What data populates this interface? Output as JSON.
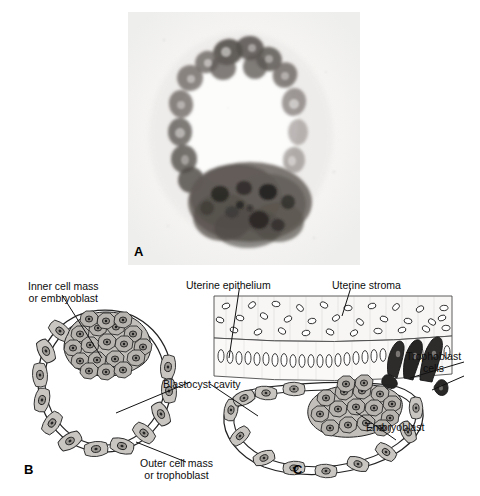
{
  "figure": {
    "domain": "biology-histology-figure",
    "background_color": "#ffffff",
    "panels": [
      {
        "letter": "A",
        "type": "photomicrograph",
        "description": "Histological section of a human blastocyst showing trophoblast ring, blastocyst cavity and inner cell mass"
      },
      {
        "letter": "B",
        "type": "line-diagram",
        "description": "Free blastocyst with inner cell mass, blastocyst cavity and outer cell mass"
      },
      {
        "letter": "C",
        "type": "line-diagram",
        "description": "Blastocyst implanting in the uterine wall"
      }
    ]
  },
  "panel_a": {
    "letter": "A"
  },
  "panel_b": {
    "letter": "B",
    "labels": {
      "inner_cell_mass_line1": "Inner cell mass",
      "inner_cell_mass_line2": "or embryoblast",
      "blastocyst_cavity": "Blastocyst cavity",
      "outer_cell_mass_line1": "Outer cell mass",
      "outer_cell_mass_line2": "or trophoblast"
    }
  },
  "panel_c": {
    "letter": "C",
    "labels": {
      "uterine_epithelium": "Uterine epithelium",
      "uterine_stroma": "Uterine stroma",
      "trophoblast_line1": "Trophoblast",
      "trophoblast_line2": "cells",
      "embryoblast": "Embryoblast"
    }
  },
  "colors": {
    "text": "#0d0d0d",
    "ink": "#1a1a1a",
    "cell_fill": "#b9b5b0",
    "cell_fill_light": "#d9d6d2",
    "nucleus": "#2b2b2b",
    "trophoblast_dark": "#3a3a3a",
    "micrograph_background": "#f2f1ef",
    "page_background": "#ffffff"
  }
}
